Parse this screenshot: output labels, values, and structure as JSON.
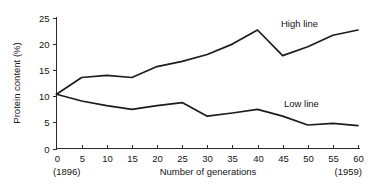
{
  "chart_data": {
    "type": "line",
    "title": "",
    "xlabel": "Number of generations",
    "ylabel": "Protein content (%)",
    "xlim": [
      0,
      60
    ],
    "ylim": [
      0,
      25
    ],
    "xticks": [
      0,
      5,
      10,
      15,
      20,
      25,
      30,
      35,
      40,
      45,
      50,
      55,
      60
    ],
    "yticks": [
      0,
      5,
      10,
      15,
      20,
      25
    ],
    "xtick_labels": [
      "0",
      "5",
      "10",
      "15",
      "20",
      "25",
      "30",
      "35",
      "40",
      "45",
      "50",
      "55",
      "60"
    ],
    "ytick_labels": [
      "0",
      "5",
      "10",
      "15",
      "20",
      "25"
    ],
    "grid": false,
    "legend_position": "inline-right",
    "x": [
      0,
      5,
      10,
      15,
      20,
      25,
      30,
      35,
      40,
      45,
      50,
      55,
      60
    ],
    "series": [
      {
        "name": "High line",
        "values": [
          10.4,
          13.6,
          14.0,
          13.6,
          15.7,
          16.7,
          18.0,
          20.0,
          22.7,
          17.8,
          19.5,
          21.7,
          22.7
        ],
        "color": "#1c1c1c"
      },
      {
        "name": "Low line",
        "values": [
          10.4,
          9.1,
          8.2,
          7.5,
          8.2,
          8.8,
          6.2,
          6.8,
          7.5,
          6.2,
          4.5,
          4.8,
          4.4
        ],
        "color": "#1c1c1c"
      }
    ],
    "annotations": [
      {
        "name": "high-line-label",
        "text": "High line",
        "x": 44.5,
        "y": 23.6
      },
      {
        "name": "low-line-label",
        "text": "Low line",
        "x": 45.0,
        "y": 8.3
      },
      {
        "name": "start-year-note",
        "text": "(1896)",
        "x": 0,
        "y": -3.9
      },
      {
        "name": "end-year-note",
        "text": "(1959)",
        "x": 60,
        "y": -3.9
      }
    ]
  },
  "axes": {
    "y_title": "Protein content (%)",
    "x_title": "Number of generations"
  },
  "notes": {
    "start_year": "(1896)",
    "end_year": "(1959)"
  },
  "labels": {
    "high_line": "High line",
    "low_line": "Low line"
  },
  "colors": {
    "background": "#ffffff",
    "axis": "#2b2b2b",
    "line": "#1c1c1c",
    "text": "#141414"
  }
}
